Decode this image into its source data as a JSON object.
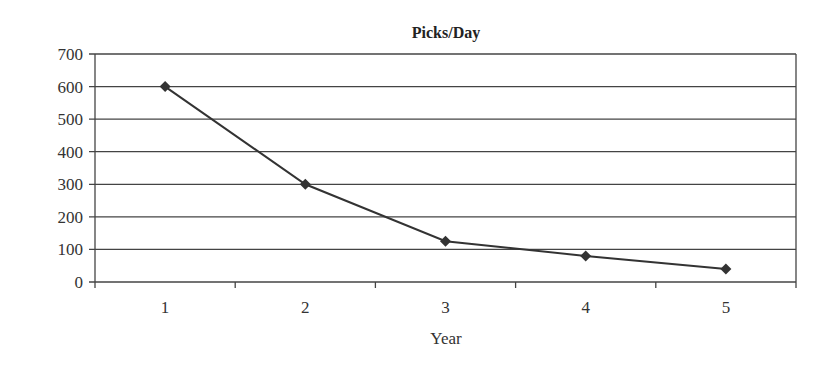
{
  "chart_data": {
    "type": "line",
    "title": "Picks/Day",
    "xlabel": "Year",
    "ylabel": "",
    "categories": [
      "1",
      "2",
      "3",
      "4",
      "5"
    ],
    "series": [
      {
        "name": "Picks/Day",
        "values": [
          600,
          300,
          125,
          80,
          40
        ],
        "marker": "diamond",
        "color": "#333333"
      }
    ],
    "yticks": [
      0,
      100,
      200,
      300,
      400,
      500,
      600,
      700
    ],
    "ylim": [
      0,
      700
    ],
    "grid": true,
    "legend": "none"
  }
}
